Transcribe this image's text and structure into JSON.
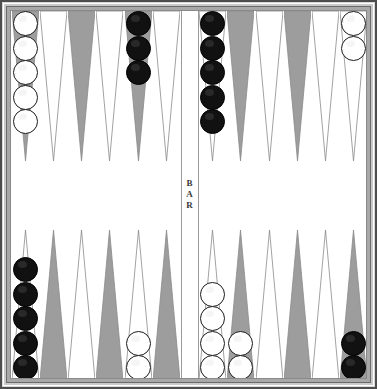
{
  "board": {
    "title": "Backgammon Board",
    "bar_label_chars": [
      "B",
      "A",
      "R"
    ],
    "bar_label": "BAR",
    "colors": {
      "point_dark": "#9d9d9d",
      "point_light": "#ffffff",
      "point_outline": "#8a8a8a",
      "checker_white": "#ffffff",
      "checker_black": "#111111",
      "frame": "#c9c9c9",
      "playfield": "#ffffff"
    },
    "geometry": {
      "width": 377,
      "height": 389,
      "point_width": 27,
      "point_height": 150,
      "checker_diameter": 25,
      "bar_width": 18
    }
  },
  "quadrants": [
    {
      "name": "top-left",
      "id": "top-left"
    },
    {
      "name": "top-right",
      "id": "top-right"
    },
    {
      "name": "bottom-left",
      "id": "bottom-left"
    },
    {
      "name": "bottom-right",
      "id": "bottom-right"
    }
  ],
  "points": [
    {
      "index": 1,
      "quadrant": "top-left",
      "slot": 0,
      "shade": "dark",
      "checkers": 5,
      "color": "white"
    },
    {
      "index": 2,
      "quadrant": "top-left",
      "slot": 1,
      "shade": "light",
      "checkers": 0,
      "color": null
    },
    {
      "index": 3,
      "quadrant": "top-left",
      "slot": 2,
      "shade": "dark",
      "checkers": 0,
      "color": null
    },
    {
      "index": 4,
      "quadrant": "top-left",
      "slot": 3,
      "shade": "light",
      "checkers": 0,
      "color": null
    },
    {
      "index": 5,
      "quadrant": "top-left",
      "slot": 4,
      "shade": "dark",
      "checkers": 3,
      "color": "black"
    },
    {
      "index": 6,
      "quadrant": "top-left",
      "slot": 5,
      "shade": "light",
      "checkers": 0,
      "color": null
    },
    {
      "index": 7,
      "quadrant": "top-right",
      "slot": 0,
      "shade": "light",
      "checkers": 5,
      "color": "black"
    },
    {
      "index": 8,
      "quadrant": "top-right",
      "slot": 1,
      "shade": "dark",
      "checkers": 0,
      "color": null
    },
    {
      "index": 9,
      "quadrant": "top-right",
      "slot": 2,
      "shade": "light",
      "checkers": 0,
      "color": null
    },
    {
      "index": 10,
      "quadrant": "top-right",
      "slot": 3,
      "shade": "dark",
      "checkers": 0,
      "color": null
    },
    {
      "index": 11,
      "quadrant": "top-right",
      "slot": 4,
      "shade": "light",
      "checkers": 0,
      "color": null
    },
    {
      "index": 12,
      "quadrant": "top-right",
      "slot": 5,
      "shade": "light",
      "checkers": 2,
      "color": "white"
    },
    {
      "index": 13,
      "quadrant": "bottom-left",
      "slot": 0,
      "shade": "light",
      "checkers": 5,
      "color": "black"
    },
    {
      "index": 14,
      "quadrant": "bottom-left",
      "slot": 1,
      "shade": "dark",
      "checkers": 0,
      "color": null
    },
    {
      "index": 15,
      "quadrant": "bottom-left",
      "slot": 2,
      "shade": "light",
      "checkers": 0,
      "color": null
    },
    {
      "index": 16,
      "quadrant": "bottom-left",
      "slot": 3,
      "shade": "dark",
      "checkers": 0,
      "color": null
    },
    {
      "index": 17,
      "quadrant": "bottom-left",
      "slot": 4,
      "shade": "light",
      "checkers": 2,
      "color": "white"
    },
    {
      "index": 18,
      "quadrant": "bottom-left",
      "slot": 5,
      "shade": "dark",
      "checkers": 0,
      "color": null
    },
    {
      "index": 19,
      "quadrant": "bottom-right",
      "slot": 0,
      "shade": "light",
      "checkers": 4,
      "color": "white"
    },
    {
      "index": 20,
      "quadrant": "bottom-right",
      "slot": 1,
      "shade": "dark",
      "checkers": 2,
      "color": "white"
    },
    {
      "index": 21,
      "quadrant": "bottom-right",
      "slot": 2,
      "shade": "light",
      "checkers": 0,
      "color": null
    },
    {
      "index": 22,
      "quadrant": "bottom-right",
      "slot": 3,
      "shade": "dark",
      "checkers": 0,
      "color": null
    },
    {
      "index": 23,
      "quadrant": "bottom-right",
      "slot": 4,
      "shade": "light",
      "checkers": 0,
      "color": null
    },
    {
      "index": 24,
      "quadrant": "bottom-right",
      "slot": 5,
      "shade": "dark",
      "checkers": 2,
      "color": "black"
    }
  ],
  "counts": {
    "white_total": 15,
    "black_total": 15
  }
}
